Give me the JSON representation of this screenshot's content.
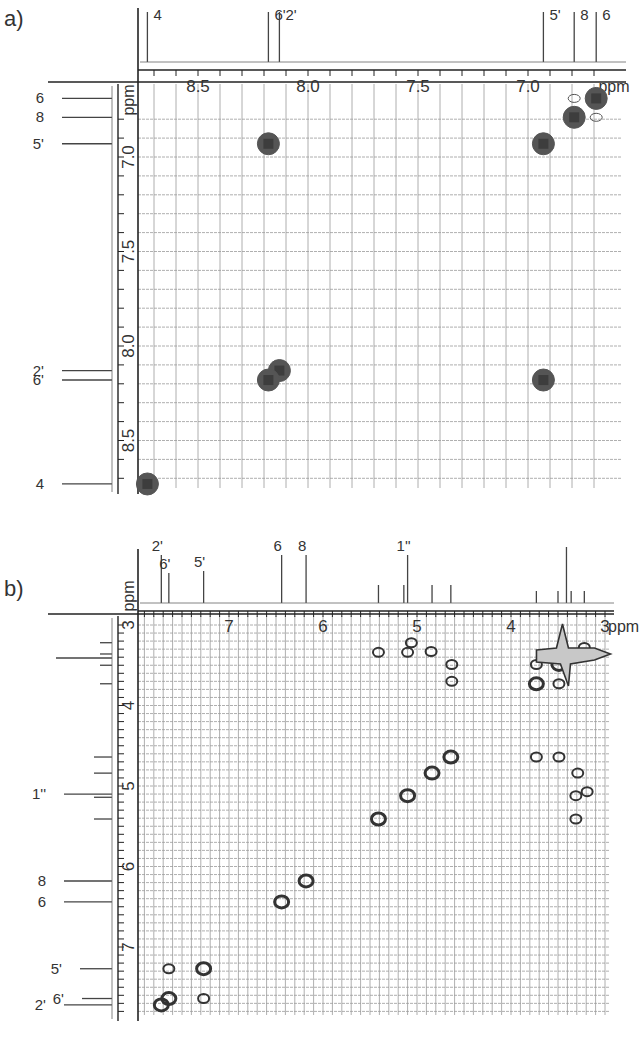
{
  "figure": {
    "panels": [
      {
        "id": "a",
        "label": "a)"
      },
      {
        "id": "b",
        "label": "b)"
      }
    ],
    "caption_fragment": ""
  },
  "chart_data": [
    {
      "type": "heatmap",
      "subtype": "2D NMR COSY contour plot (aromatic region)",
      "title": "a)",
      "xlabel": "ppm",
      "ylabel": "ppm",
      "xlim": [
        8.77,
        6.62
      ],
      "ylim": [
        6.8,
        8.75
      ],
      "x_ticks": [
        8.5,
        8.0,
        7.5,
        7.0
      ],
      "y_ticks": [
        7.0,
        7.5,
        8.0,
        8.5
      ],
      "grid": true,
      "grid_step_ppm": 0.1,
      "projection_peaks": [
        {
          "label": "4",
          "ppm": 8.73
        },
        {
          "label": "6'",
          "ppm": 8.18
        },
        {
          "label": "2'",
          "ppm": 8.13
        },
        {
          "label": "5'",
          "ppm": 6.93
        },
        {
          "label": "8",
          "ppm": 6.79
        },
        {
          "label": "6",
          "ppm": 6.69
        }
      ],
      "cross_peaks": [
        {
          "x": 6.69,
          "y": 6.69,
          "kind": "diagonal"
        },
        {
          "x": 6.79,
          "y": 6.79,
          "kind": "diagonal"
        },
        {
          "x": 6.93,
          "y": 6.93,
          "kind": "diagonal"
        },
        {
          "x": 8.13,
          "y": 8.13,
          "kind": "diagonal"
        },
        {
          "x": 8.18,
          "y": 8.18,
          "kind": "diagonal"
        },
        {
          "x": 8.73,
          "y": 8.73,
          "kind": "diagonal"
        },
        {
          "x": 8.18,
          "y": 6.93,
          "kind": "off-diagonal"
        },
        {
          "x": 6.93,
          "y": 8.18,
          "kind": "off-diagonal"
        },
        {
          "x": 6.79,
          "y": 6.69,
          "kind": "weak"
        },
        {
          "x": 6.69,
          "y": 6.79,
          "kind": "weak"
        }
      ]
    },
    {
      "type": "heatmap",
      "subtype": "2D NMR COSY contour plot (full region)",
      "title": "b)",
      "xlabel": "ppm",
      "ylabel": "ppm",
      "xlim": [
        7.97,
        2.95
      ],
      "ylim": [
        2.95,
        7.8
      ],
      "x_ticks": [
        7,
        6,
        5,
        4,
        3
      ],
      "y_ticks": [
        3,
        4,
        5,
        6,
        7
      ],
      "grid": true,
      "grid_step_ppm": 0.2,
      "projection_peaks": [
        {
          "label": "2'",
          "ppm": 7.72
        },
        {
          "label": "6'",
          "ppm": 7.64
        },
        {
          "label": "5'",
          "ppm": 7.27
        },
        {
          "label": "6",
          "ppm": 6.44
        },
        {
          "label": "8",
          "ppm": 6.18
        },
        {
          "label": "1''",
          "ppm": 5.1
        },
        {
          "label": "",
          "ppm": 5.41
        },
        {
          "label": "",
          "ppm": 5.14
        },
        {
          "label": "",
          "ppm": 4.84
        },
        {
          "label": "",
          "ppm": 4.64
        },
        {
          "label": "",
          "ppm": 3.73
        },
        {
          "label": "",
          "ppm": 3.5
        },
        {
          "label": "",
          "ppm": 3.41
        },
        {
          "label": "",
          "ppm": 3.36
        },
        {
          "label": "",
          "ppm": 3.22
        }
      ],
      "cross_peaks": [
        {
          "x": 7.72,
          "y": 7.72
        },
        {
          "x": 7.64,
          "y": 7.64
        },
        {
          "x": 7.64,
          "y": 7.27
        },
        {
          "x": 7.27,
          "y": 7.27
        },
        {
          "x": 7.27,
          "y": 7.64
        },
        {
          "x": 6.44,
          "y": 6.44
        },
        {
          "x": 6.18,
          "y": 6.18
        },
        {
          "x": 5.41,
          "y": 5.41
        },
        {
          "x": 5.1,
          "y": 5.12
        },
        {
          "x": 4.84,
          "y": 4.84
        },
        {
          "x": 4.64,
          "y": 4.64
        },
        {
          "x": 5.41,
          "y": 3.34
        },
        {
          "x": 5.06,
          "y": 3.22
        },
        {
          "x": 5.1,
          "y": 3.34
        },
        {
          "x": 4.85,
          "y": 3.33
        },
        {
          "x": 4.63,
          "y": 3.49
        },
        {
          "x": 4.63,
          "y": 3.7
        },
        {
          "x": 3.73,
          "y": 3.49
        },
        {
          "x": 3.73,
          "y": 3.73
        },
        {
          "x": 3.49,
          "y": 3.73
        },
        {
          "x": 3.49,
          "y": 3.49
        },
        {
          "x": 3.22,
          "y": 3.28
        },
        {
          "x": 3.36,
          "y": 3.41
        },
        {
          "x": 3.73,
          "y": 4.64
        },
        {
          "x": 3.49,
          "y": 4.64
        },
        {
          "x": 3.29,
          "y": 4.84
        },
        {
          "x": 3.31,
          "y": 5.12
        },
        {
          "x": 3.19,
          "y": 5.07
        },
        {
          "x": 3.31,
          "y": 5.41
        }
      ]
    }
  ]
}
